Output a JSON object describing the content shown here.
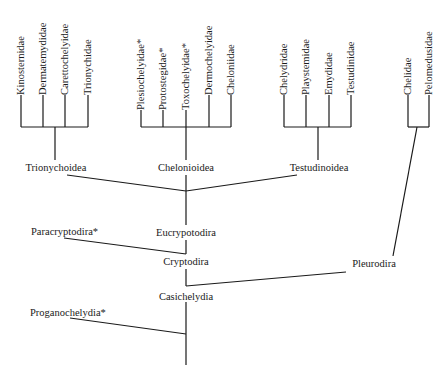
{
  "diagram": {
    "title": "",
    "type": "phylogenetic-tree",
    "note": "* denotes extinct taxa",
    "line_color": "#1a1a1a",
    "groups": [
      {
        "name": "Trionychoidea",
        "leaves": [
          "Kinosternidae",
          "Dermatemydidae",
          "Carettochelyidae",
          "Trionychidae"
        ]
      },
      {
        "name": "Chelonioidea",
        "leaves": [
          "Plesiochelyidae*",
          "Protostegidae*",
          "Toxochelyidae*",
          "Dermochelyidae",
          "Cheloniidae"
        ]
      },
      {
        "name": "Testudinoidea",
        "leaves": [
          "Chelydridae",
          "Playstemidae",
          "Emydidae",
          "Testudinidae"
        ]
      },
      {
        "name": "Pleurodira",
        "leaves": [
          "Chelidae",
          "Pelomedusidae"
        ]
      }
    ],
    "internal_nodes": {
      "eucryptodira": "Eucrypotodira",
      "paracryptodira": "Paracryptodira*",
      "cryptodira": "Cryptodira",
      "pleurodira": "Pleurodira",
      "casichelydia": "Casichelydia",
      "proganochelydia": "Proganochelydia*"
    }
  }
}
